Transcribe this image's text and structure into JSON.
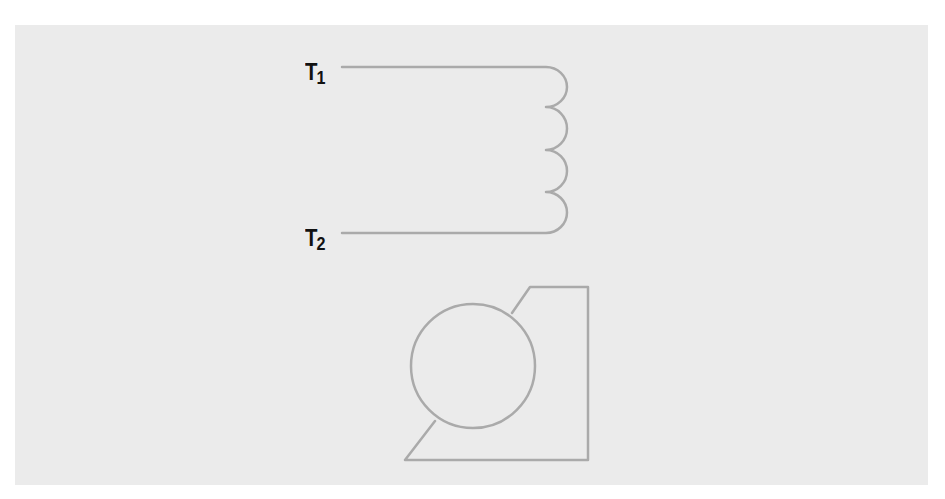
{
  "diagram": {
    "terminals": [
      {
        "label": "T",
        "subscript": "1"
      },
      {
        "label": "T",
        "subscript": "2"
      }
    ],
    "components": {
      "coil": {
        "name": "inductor-winding",
        "turns": 4
      },
      "motor": {
        "name": "motor-symbol"
      }
    },
    "colors": {
      "background": "#ebebeb",
      "line": "#aaaaaa",
      "label": "#111111"
    }
  }
}
